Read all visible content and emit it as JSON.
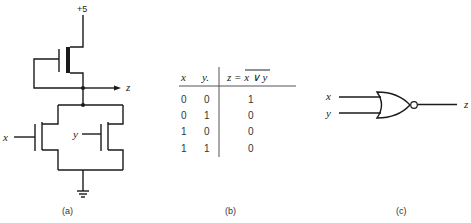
{
  "panel_a": {
    "caption": "(a)",
    "supply_label": "+5",
    "output_label": "z",
    "input_x_label": "x",
    "input_y_label": "y"
  },
  "panel_b": {
    "caption": "(b)",
    "headers": {
      "x": "x",
      "y": "y.",
      "z_prefix": "z = ",
      "z_expr": "x ∨ y"
    },
    "rows": [
      {
        "x": "0",
        "y": "0",
        "z": "1"
      },
      {
        "x": "0",
        "y": "1",
        "z": "0"
      },
      {
        "x": "1",
        "y": "0",
        "z": "0"
      },
      {
        "x": "1",
        "y": "1",
        "z": "0"
      }
    ]
  },
  "panel_c": {
    "caption": "(c)",
    "input_x_label": "x",
    "input_y_label": "y",
    "output_label": "z",
    "gate_type": "NOR"
  }
}
